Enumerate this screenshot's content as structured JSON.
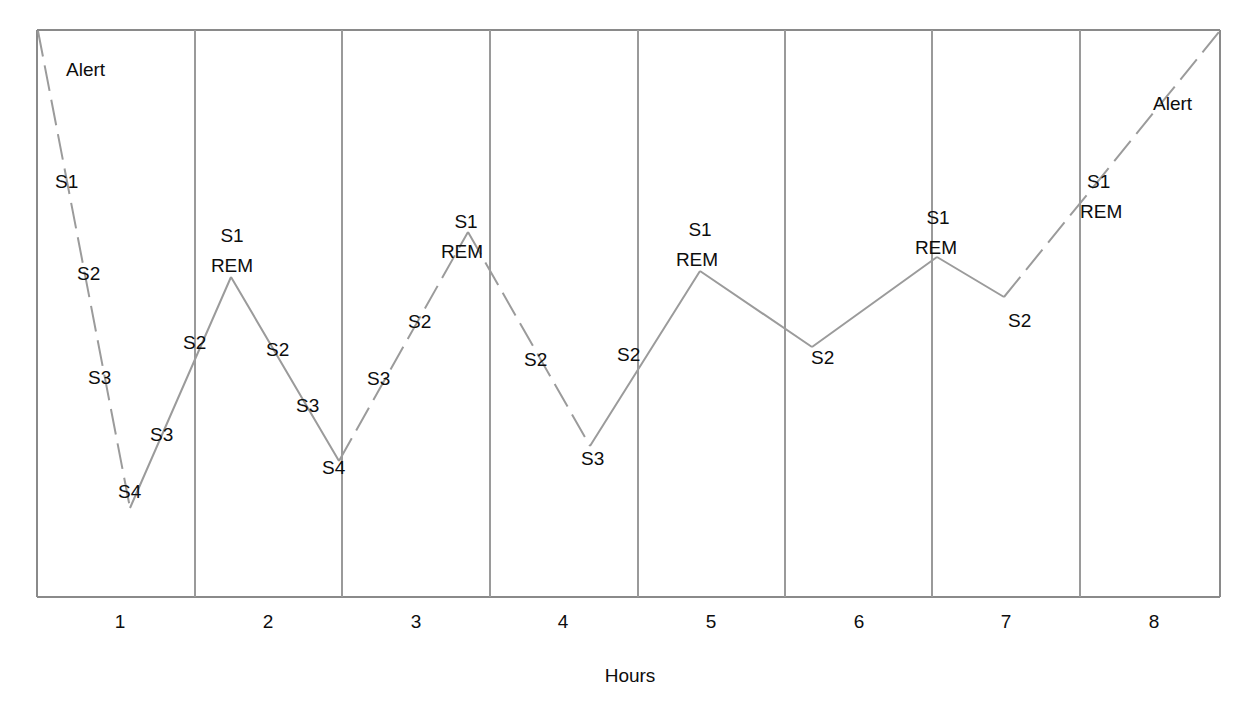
{
  "chart_data": {
    "type": "line",
    "title": "",
    "subtitle": "",
    "xlabel": "Hours",
    "ylabel": "",
    "grid": "vertical-panel-dividers",
    "legend": "none",
    "xlim": [
      0.5,
      8.5
    ],
    "ylim_stages": [
      "Alert",
      "REM",
      "S1",
      "S2",
      "S3",
      "S4"
    ],
    "x_tick_labels": [
      "1",
      "2",
      "3",
      "4",
      "5",
      "6",
      "7",
      "8"
    ],
    "x_ticks": [
      1,
      2,
      3,
      4,
      5,
      6,
      7,
      8
    ],
    "series": [
      {
        "name": "Sleep stage",
        "description": "Hypnogram tracing sleep depth across eight hours of night sleep",
        "points": [
          {
            "hour": 0.5,
            "stage": "Alert",
            "depth": 0.0
          },
          {
            "hour": 1.12,
            "stage": "S4",
            "depth": 5.0
          },
          {
            "hour": 1.82,
            "stage": "REM",
            "depth": 1.68
          },
          {
            "hour": 2.45,
            "stage": "S4",
            "depth": 4.4
          },
          {
            "hour": 3.42,
            "stage": "REM",
            "depth": 1.25
          },
          {
            "hour": 4.26,
            "stage": "S3",
            "depth": 3.95
          },
          {
            "hour": 5.02,
            "stage": "REM",
            "depth": 1.6
          },
          {
            "hour": 5.73,
            "stage": "S2",
            "depth": 2.8
          },
          {
            "hour": 6.7,
            "stage": "REM",
            "depth": 1.45
          },
          {
            "hour": 7.16,
            "stage": "S2",
            "depth": 1.9
          },
          {
            "hour": 8.5,
            "stage": "Alert",
            "depth": 0.05
          }
        ],
        "segment_styles": [
          "dashed",
          "solid",
          "solid",
          "dashed",
          "solid",
          "solid",
          "dashed",
          "solid",
          "solid",
          "dashed"
        ]
      }
    ],
    "point_annotations": [
      {
        "text": "Alert",
        "x": 66,
        "y": 76,
        "anchor": "start"
      },
      {
        "text": "S1",
        "x": 55,
        "y": 188,
        "anchor": "start"
      },
      {
        "text": "S2",
        "x": 77,
        "y": 280,
        "anchor": "start"
      },
      {
        "text": "S3",
        "x": 88,
        "y": 384,
        "anchor": "start"
      },
      {
        "text": "S4",
        "x": 118,
        "y": 498,
        "anchor": "start"
      },
      {
        "text": "S3",
        "x": 150,
        "y": 441,
        "anchor": "start"
      },
      {
        "text": "S2",
        "x": 183,
        "y": 349,
        "anchor": "start"
      },
      {
        "text": "S1",
        "x": 232,
        "y": 242,
        "anchor": "middle"
      },
      {
        "text": "REM",
        "x": 232,
        "y": 272,
        "anchor": "middle"
      },
      {
        "text": "S2",
        "x": 266,
        "y": 356,
        "anchor": "start"
      },
      {
        "text": "S3",
        "x": 296,
        "y": 412,
        "anchor": "start"
      },
      {
        "text": "S4",
        "x": 322,
        "y": 474,
        "anchor": "start"
      },
      {
        "text": "S3",
        "x": 367,
        "y": 385,
        "anchor": "start"
      },
      {
        "text": "S2",
        "x": 408,
        "y": 328,
        "anchor": "start"
      },
      {
        "text": "S1",
        "x": 466,
        "y": 228,
        "anchor": "middle"
      },
      {
        "text": "REM",
        "x": 462,
        "y": 258,
        "anchor": "middle"
      },
      {
        "text": "S2",
        "x": 524,
        "y": 366,
        "anchor": "start"
      },
      {
        "text": "S3",
        "x": 581,
        "y": 465,
        "anchor": "start"
      },
      {
        "text": "S2",
        "x": 617,
        "y": 361,
        "anchor": "start"
      },
      {
        "text": "S1",
        "x": 700,
        "y": 236,
        "anchor": "middle"
      },
      {
        "text": "REM",
        "x": 697,
        "y": 266,
        "anchor": "middle"
      },
      {
        "text": "S2",
        "x": 811,
        "y": 364,
        "anchor": "start"
      },
      {
        "text": "S1",
        "x": 938,
        "y": 224,
        "anchor": "middle"
      },
      {
        "text": "REM",
        "x": 936,
        "y": 254,
        "anchor": "middle"
      },
      {
        "text": "S2",
        "x": 1008,
        "y": 327,
        "anchor": "start"
      },
      {
        "text": "S1",
        "x": 1087,
        "y": 188,
        "anchor": "start"
      },
      {
        "text": "REM",
        "x": 1080,
        "y": 218,
        "anchor": "start"
      },
      {
        "text": "Alert",
        "x": 1153,
        "y": 110,
        "anchor": "start"
      }
    ],
    "colors": {
      "trace": "#9b9b9b",
      "frame": "#8a8a8a",
      "divider": "#9a9a9a",
      "text": "#0d0d0d",
      "background": "#ffffff"
    }
  },
  "axis": {
    "x_title": "Hours",
    "x_title_position": {
      "x": 630,
      "y": 682
    },
    "tick_label_y": 628,
    "tick_positions": [
      120,
      268,
      416,
      563,
      711,
      859,
      1006,
      1154
    ]
  },
  "plot_frame": {
    "left": 37,
    "right": 1220,
    "top": 30,
    "bottom": 597,
    "divider_x": [
      195,
      342,
      490,
      638,
      785,
      932,
      1080
    ]
  },
  "trace_path_solid": "M130,508 L231,277 M231,277 L339,461 M590,446 L700,271 M700,271 L812,347 M812,347 L937,257 M937,257 L1004,297",
  "trace_path_dashed": "M38,31 L130,508 M339,461 L468,232 M468,232 L590,446 M1004,297 L1219,32"
}
